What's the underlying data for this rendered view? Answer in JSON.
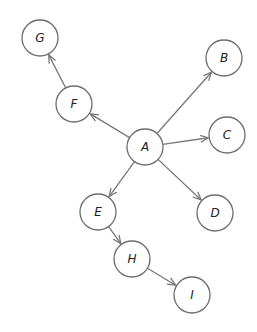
{
  "diagram": {
    "type": "directed-graph",
    "node_radius": 18,
    "colors": {
      "stroke": "#6e6e6e",
      "edge": "#777777",
      "text": "#222222",
      "background": "#ffffff"
    },
    "nodes": [
      {
        "id": "A",
        "label": "A",
        "x": 145,
        "y": 147
      },
      {
        "id": "B",
        "label": "B",
        "x": 224,
        "y": 58
      },
      {
        "id": "C",
        "label": "C",
        "x": 227,
        "y": 135
      },
      {
        "id": "D",
        "label": "D",
        "x": 215,
        "y": 213
      },
      {
        "id": "E",
        "label": "E",
        "x": 98,
        "y": 212
      },
      {
        "id": "F",
        "label": "F",
        "x": 74,
        "y": 104
      },
      {
        "id": "G",
        "label": "G",
        "x": 40,
        "y": 38
      },
      {
        "id": "H",
        "label": "H",
        "x": 132,
        "y": 259
      },
      {
        "id": "I",
        "label": "I",
        "x": 192,
        "y": 295
      }
    ],
    "edges": [
      {
        "from": "A",
        "to": "B"
      },
      {
        "from": "A",
        "to": "C"
      },
      {
        "from": "A",
        "to": "D"
      },
      {
        "from": "A",
        "to": "E"
      },
      {
        "from": "A",
        "to": "F"
      },
      {
        "from": "F",
        "to": "G"
      },
      {
        "from": "E",
        "to": "H"
      },
      {
        "from": "H",
        "to": "I"
      }
    ]
  }
}
